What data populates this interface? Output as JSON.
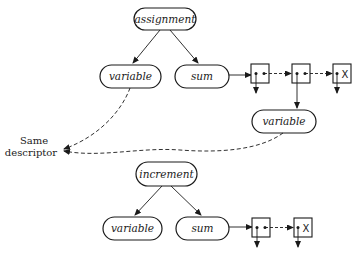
{
  "diagram": {
    "colors": {
      "stroke": "#1a1a1a",
      "background": "#ffffff"
    },
    "upper_tree": {
      "root": {
        "label": "assignment"
      },
      "left_child": {
        "label": "variable"
      },
      "right_child": {
        "label": "sum"
      },
      "list_nodes": [
        {
          "id": "box1",
          "terminal": false
        },
        {
          "id": "box2",
          "terminal": false
        },
        {
          "id": "box3",
          "terminal": true,
          "terminal_label": "X"
        }
      ],
      "list_variable": {
        "label": "variable"
      }
    },
    "shared_label": {
      "line1": "Same",
      "line2": "descriptor"
    },
    "lower_tree": {
      "root": {
        "label": "increment"
      },
      "left_child": {
        "label": "variable"
      },
      "right_child": {
        "label": "sum"
      },
      "list_nodes": [
        {
          "id": "box4",
          "terminal": false
        },
        {
          "id": "box5",
          "terminal": true,
          "terminal_label": "X"
        }
      ]
    }
  }
}
